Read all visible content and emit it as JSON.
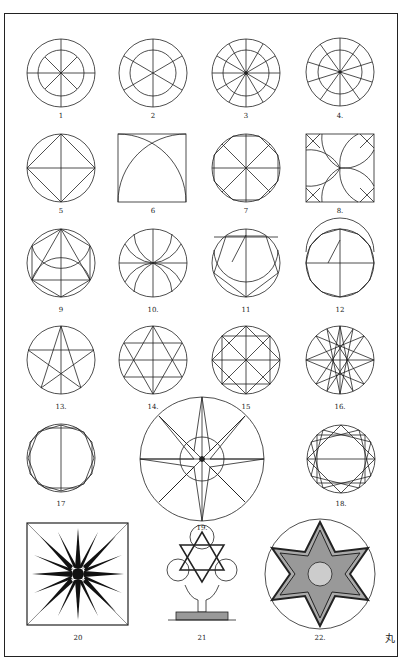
{
  "plate": {
    "type": "geometric ornament construction plate",
    "figure_labels": [
      "1",
      "2",
      "3",
      "4.",
      "5",
      "6",
      "7",
      "8.",
      "9",
      "10.",
      "11",
      "12",
      "13.",
      "14.",
      "15",
      "16.",
      "17",
      "18.",
      "19.",
      "20",
      "21",
      "22."
    ],
    "monogram": "丸"
  },
  "figures": [
    {
      "n": "1",
      "desc": "circle with inner circle, 8 radial spokes"
    },
    {
      "n": "2",
      "desc": "circle with inner circle, 6 radial spokes"
    },
    {
      "n": "3",
      "desc": "circle with inner circle, 12 radial spokes"
    },
    {
      "n": "4",
      "desc": "circle with inner circle, 10 radial spokes"
    },
    {
      "n": "5",
      "desc": "circle with inscribed square (diamond) and cross"
    },
    {
      "n": "6",
      "desc": "square with two quarter-arcs"
    },
    {
      "n": "7",
      "desc": "circle with inscribed octagon and 8 spokes"
    },
    {
      "n": "8",
      "desc": "square with corner diagonals and arcs"
    },
    {
      "n": "9",
      "desc": "circle with inscribed hexagon construction"
    },
    {
      "n": "10",
      "desc": "circle with petal arcs"
    },
    {
      "n": "11",
      "desc": "circle with pentagon construction"
    },
    {
      "n": "12",
      "desc": "circle with polygon construction"
    },
    {
      "n": "13",
      "desc": "pentagram in circle"
    },
    {
      "n": "14",
      "desc": "hexagram in circle"
    },
    {
      "n": "15",
      "desc": "two overlapping squares (octagram) in circle"
    },
    {
      "n": "16",
      "desc": "eight-pointed star polygon in circle"
    },
    {
      "n": "17",
      "desc": "circle with inscribed polygon construction"
    },
    {
      "n": "18",
      "desc": "twelve-pointed star construction in circle"
    },
    {
      "n": "19",
      "desc": "large eight-pointed compass star in circle"
    },
    {
      "n": "20",
      "desc": "black sunburst star in square"
    },
    {
      "n": "21",
      "desc": "interlaced hexagram ornament on pedestal"
    },
    {
      "n": "22",
      "desc": "eight-pointed star medallion with foliage in circle"
    }
  ]
}
